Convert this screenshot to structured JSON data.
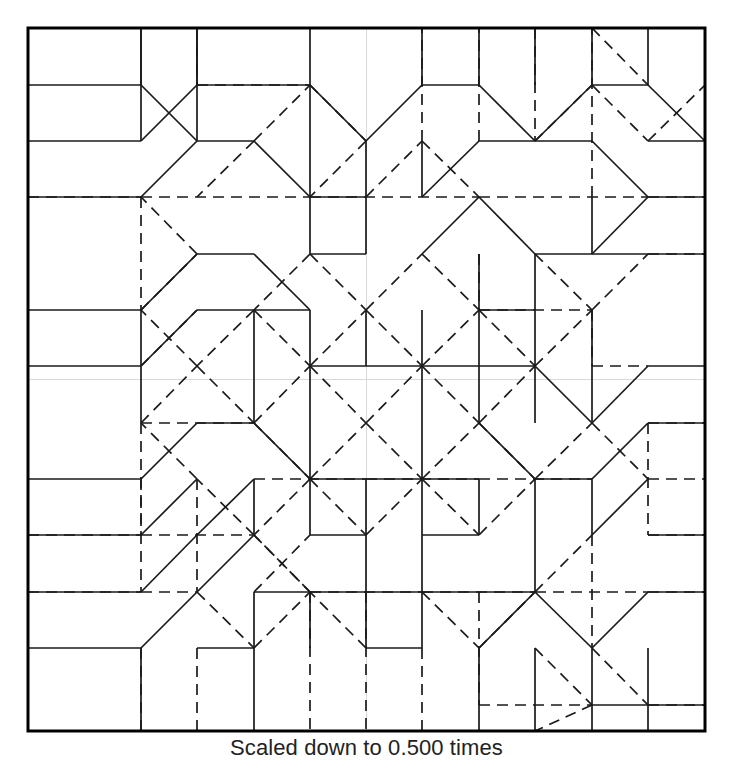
{
  "figure": {
    "type": "origami-crease-pattern",
    "caption": "Scaled down to 0.500 times",
    "colors": {
      "ink": "#1a1a1a",
      "border": "#000000",
      "guide": "#d9d9d9",
      "background": "#ffffff"
    },
    "paper": {
      "left": 28,
      "top": 28,
      "right": 705,
      "bottom": 731,
      "width": 677,
      "height": 703,
      "border_width": 3
    },
    "grid": {
      "columns": 12,
      "rows": 12,
      "cell_width": 56.4,
      "cell_height": 58.6,
      "center_guides": {
        "vertical_x": 366.5,
        "horizontal_y": 379.5
      }
    },
    "legend": {
      "solid_label": "mountain/valley crease (solid)",
      "dashed_label": "crease (dashed)",
      "guide_label": "center guide line"
    },
    "stroke": {
      "solid_width": 1.7,
      "dashed_width": 1.7,
      "dash_pattern": "11 7",
      "guide_width": 1
    }
  },
  "crease_pattern": {
    "units": "pixels",
    "note": "Coordinates are in the 733x768 image space. 'S' = solid crease, 'D' = dashed crease, 'G' = faint guide.",
    "solid": [
      [
        28,
        28,
        705,
        28
      ],
      [
        28,
        731,
        705,
        731
      ],
      [
        28,
        28,
        28,
        731
      ],
      [
        705,
        28,
        705,
        731
      ],
      [
        141,
        28,
        141,
        141
      ],
      [
        197,
        28,
        197,
        85
      ],
      [
        310,
        28,
        310,
        141
      ],
      [
        28,
        141,
        141,
        141
      ],
      [
        141,
        141,
        197,
        85
      ],
      [
        197,
        85,
        310,
        85
      ],
      [
        310,
        85,
        366,
        141
      ],
      [
        366,
        141,
        422,
        85
      ],
      [
        422,
        85,
        479,
        85
      ],
      [
        479,
        85,
        535,
        141
      ],
      [
        535,
        28,
        535,
        85
      ],
      [
        592,
        28,
        592,
        85
      ],
      [
        28,
        197,
        141,
        197
      ],
      [
        141,
        197,
        197,
        141
      ],
      [
        197,
        141,
        197,
        28
      ],
      [
        310,
        141,
        310,
        197
      ],
      [
        310,
        197,
        366,
        197
      ],
      [
        366,
        197,
        366,
        141
      ],
      [
        422,
        28,
        422,
        85
      ],
      [
        479,
        28,
        479,
        85
      ],
      [
        535,
        141,
        592,
        85
      ],
      [
        592,
        85,
        648,
        85
      ],
      [
        648,
        85,
        705,
        141
      ],
      [
        648,
        28,
        648,
        85
      ],
      [
        28,
        310,
        141,
        310
      ],
      [
        141,
        310,
        197,
        254
      ],
      [
        197,
        254,
        254,
        254
      ],
      [
        254,
        254,
        310,
        310
      ],
      [
        310,
        254,
        310,
        197
      ],
      [
        366,
        254,
        366,
        197
      ],
      [
        310,
        254,
        366,
        254
      ],
      [
        422,
        197,
        479,
        141
      ],
      [
        479,
        141,
        592,
        141
      ],
      [
        592,
        141,
        648,
        197
      ],
      [
        648,
        197,
        705,
        197
      ],
      [
        422,
        197,
        422,
        141
      ],
      [
        479,
        197,
        535,
        254
      ],
      [
        535,
        254,
        592,
        254
      ],
      [
        592,
        254,
        648,
        197
      ],
      [
        592,
        197,
        592,
        254
      ],
      [
        422,
        254,
        479,
        197
      ],
      [
        535,
        254,
        535,
        310
      ],
      [
        479,
        310,
        535,
        310
      ],
      [
        479,
        254,
        479,
        310
      ],
      [
        254,
        310,
        310,
        310
      ],
      [
        141,
        366,
        197,
        310
      ],
      [
        197,
        310,
        254,
        310
      ],
      [
        28,
        366,
        141,
        366
      ],
      [
        141,
        366,
        141,
        310
      ],
      [
        254,
        310,
        254,
        366
      ],
      [
        310,
        310,
        310,
        366
      ],
      [
        366,
        310,
        366,
        366
      ],
      [
        422,
        310,
        422,
        366
      ],
      [
        479,
        310,
        479,
        366
      ],
      [
        535,
        310,
        535,
        366
      ],
      [
        592,
        310,
        592,
        366
      ],
      [
        648,
        254,
        705,
        254
      ],
      [
        592,
        254,
        648,
        254
      ],
      [
        310,
        366,
        366,
        366
      ],
      [
        366,
        366,
        422,
        366
      ],
      [
        422,
        366,
        479,
        366
      ],
      [
        141,
        423,
        141,
        366
      ],
      [
        254,
        366,
        254,
        423
      ],
      [
        310,
        366,
        310,
        479
      ],
      [
        422,
        366,
        422,
        479
      ],
      [
        479,
        366,
        479,
        423
      ],
      [
        592,
        366,
        592,
        423
      ],
      [
        648,
        366,
        705,
        366
      ],
      [
        592,
        423,
        648,
        366
      ],
      [
        28,
        479,
        141,
        479
      ],
      [
        141,
        479,
        197,
        423
      ],
      [
        197,
        423,
        254,
        423
      ],
      [
        254,
        423,
        310,
        479
      ],
      [
        479,
        423,
        535,
        479
      ],
      [
        535,
        479,
        592,
        479
      ],
      [
        592,
        479,
        648,
        423
      ],
      [
        648,
        423,
        705,
        423
      ],
      [
        310,
        479,
        366,
        479
      ],
      [
        366,
        479,
        422,
        479
      ],
      [
        422,
        479,
        479,
        479
      ],
      [
        141,
        535,
        197,
        479
      ],
      [
        197,
        535,
        254,
        479
      ],
      [
        28,
        535,
        141,
        535
      ],
      [
        254,
        479,
        254,
        535
      ],
      [
        366,
        479,
        366,
        592
      ],
      [
        310,
        535,
        366,
        535
      ],
      [
        310,
        479,
        310,
        535
      ],
      [
        422,
        479,
        422,
        592
      ],
      [
        479,
        535,
        479,
        479
      ],
      [
        422,
        535,
        479,
        535
      ],
      [
        535,
        479,
        535,
        592
      ],
      [
        592,
        535,
        648,
        479
      ],
      [
        648,
        535,
        705,
        535
      ],
      [
        592,
        479,
        592,
        535
      ],
      [
        28,
        592,
        141,
        592
      ],
      [
        141,
        592,
        197,
        535
      ],
      [
        197,
        592,
        254,
        535
      ],
      [
        254,
        592,
        310,
        592
      ],
      [
        310,
        592,
        366,
        592
      ],
      [
        366,
        592,
        422,
        592
      ],
      [
        422,
        592,
        479,
        592
      ],
      [
        479,
        592,
        535,
        592
      ],
      [
        535,
        592,
        592,
        648
      ],
      [
        592,
        648,
        648,
        592
      ],
      [
        648,
        592,
        705,
        592
      ],
      [
        254,
        592,
        254,
        731
      ],
      [
        310,
        592,
        310,
        648
      ],
      [
        366,
        648,
        422,
        648
      ],
      [
        366,
        592,
        366,
        648
      ],
      [
        422,
        592,
        422,
        648
      ],
      [
        479,
        648,
        535,
        592
      ],
      [
        479,
        648,
        479,
        731
      ],
      [
        592,
        648,
        592,
        731
      ],
      [
        141,
        648,
        141,
        731
      ],
      [
        648,
        648,
        648,
        731
      ],
      [
        535,
        648,
        535,
        731
      ],
      [
        197,
        648,
        254,
        648
      ],
      [
        28,
        648,
        141,
        648
      ],
      [
        141,
        648,
        197,
        592
      ],
      [
        592,
        705,
        648,
        705
      ],
      [
        648,
        705,
        705,
        705
      ],
      [
        141,
        85,
        197,
        141
      ],
      [
        28,
        85,
        141,
        85
      ],
      [
        141,
        85,
        141,
        28
      ],
      [
        254,
        141,
        310,
        197
      ],
      [
        197,
        141,
        254,
        141
      ],
      [
        648,
        141,
        705,
        141
      ],
      [
        535,
        366,
        592,
        423
      ],
      [
        479,
        366,
        535,
        366
      ],
      [
        535,
        366,
        535,
        423
      ]
    ],
    "dashed": [
      [
        197,
        28,
        197,
        85
      ],
      [
        141,
        197,
        310,
        197
      ],
      [
        197,
        85,
        310,
        85
      ],
      [
        141,
        197,
        141,
        310
      ],
      [
        28,
        197,
        141,
        197
      ],
      [
        310,
        197,
        479,
        197
      ],
      [
        479,
        197,
        648,
        197
      ],
      [
        535,
        28,
        535,
        141
      ],
      [
        648,
        197,
        705,
        197
      ],
      [
        592,
        197,
        592,
        28
      ],
      [
        310,
        254,
        366,
        310
      ],
      [
        366,
        310,
        422,
        254
      ],
      [
        422,
        254,
        479,
        310
      ],
      [
        479,
        310,
        535,
        366
      ],
      [
        310,
        254,
        254,
        310
      ],
      [
        254,
        310,
        310,
        366
      ],
      [
        310,
        366,
        366,
        423
      ],
      [
        366,
        423,
        422,
        366
      ],
      [
        422,
        366,
        479,
        310
      ],
      [
        254,
        310,
        197,
        366
      ],
      [
        197,
        366,
        254,
        423
      ],
      [
        254,
        423,
        310,
        366
      ],
      [
        310,
        366,
        366,
        310
      ],
      [
        366,
        310,
        422,
        366
      ],
      [
        422,
        366,
        479,
        423
      ],
      [
        479,
        423,
        535,
        366
      ],
      [
        535,
        366,
        592,
        310
      ],
      [
        310,
        479,
        366,
        423
      ],
      [
        366,
        423,
        422,
        479
      ],
      [
        422,
        479,
        479,
        423
      ],
      [
        254,
        423,
        310,
        479
      ],
      [
        310,
        479,
        254,
        535
      ],
      [
        254,
        535,
        197,
        479
      ],
      [
        197,
        479,
        141,
        423
      ],
      [
        141,
        423,
        197,
        366
      ],
      [
        197,
        366,
        141,
        310
      ],
      [
        141,
        310,
        197,
        254
      ],
      [
        197,
        254,
        141,
        197
      ],
      [
        310,
        85,
        366,
        141
      ],
      [
        366,
        141,
        310,
        197
      ],
      [
        254,
        141,
        310,
        85
      ],
      [
        254,
        141,
        197,
        197
      ],
      [
        310,
        479,
        366,
        535
      ],
      [
        366,
        535,
        422,
        479
      ],
      [
        422,
        479,
        479,
        535
      ],
      [
        479,
        535,
        535,
        479
      ],
      [
        535,
        479,
        592,
        423
      ],
      [
        592,
        423,
        648,
        479
      ],
      [
        648,
        479,
        705,
        479
      ],
      [
        592,
        310,
        648,
        254
      ],
      [
        648,
        254,
        705,
        254
      ],
      [
        479,
        423,
        535,
        479
      ],
      [
        141,
        479,
        141,
        592
      ],
      [
        28,
        592,
        141,
        592
      ],
      [
        141,
        592,
        197,
        592
      ],
      [
        592,
        535,
        592,
        648
      ],
      [
        648,
        592,
        705,
        592
      ],
      [
        535,
        592,
        592,
        535
      ],
      [
        592,
        648,
        648,
        705
      ],
      [
        648,
        705,
        705,
        705
      ],
      [
        535,
        648,
        592,
        705
      ],
      [
        592,
        705,
        535,
        731
      ],
      [
        141,
        648,
        141,
        731
      ],
      [
        197,
        648,
        197,
        731
      ],
      [
        310,
        592,
        310,
        731
      ],
      [
        366,
        592,
        366,
        731
      ],
      [
        422,
        648,
        422,
        731
      ],
      [
        422,
        592,
        479,
        648
      ],
      [
        479,
        648,
        535,
        592
      ],
      [
        366,
        648,
        310,
        592
      ],
      [
        197,
        592,
        254,
        648
      ],
      [
        254,
        648,
        310,
        592
      ],
      [
        310,
        592,
        254,
        535
      ],
      [
        254,
        535,
        310,
        592
      ],
      [
        254,
        592,
        310,
        535
      ],
      [
        592,
        366,
        648,
        366
      ],
      [
        479,
        310,
        592,
        310
      ],
      [
        592,
        310,
        592,
        366
      ],
      [
        479,
        254,
        479,
        310
      ],
      [
        535,
        254,
        592,
        310
      ],
      [
        366,
        197,
        422,
        141
      ],
      [
        422,
        141,
        479,
        197
      ],
      [
        535,
        141,
        592,
        85
      ],
      [
        592,
        85,
        648,
        141
      ],
      [
        648,
        141,
        705,
        85
      ],
      [
        592,
        28,
        648,
        85
      ],
      [
        141,
        423,
        254,
        423
      ],
      [
        141,
        423,
        141,
        535
      ],
      [
        28,
        535,
        141,
        535
      ],
      [
        141,
        535,
        254,
        535
      ],
      [
        254,
        479,
        366,
        479
      ],
      [
        366,
        479,
        479,
        479
      ],
      [
        479,
        479,
        592,
        479
      ],
      [
        479,
        141,
        479,
        28
      ],
      [
        422,
        141,
        422,
        28
      ],
      [
        310,
        592,
        422,
        592
      ],
      [
        422,
        592,
        535,
        592
      ],
      [
        535,
        592,
        648,
        592
      ],
      [
        197,
        479,
        197,
        592
      ],
      [
        648,
        423,
        648,
        535
      ],
      [
        648,
        535,
        705,
        535
      ],
      [
        648,
        423,
        705,
        423
      ],
      [
        479,
        592,
        479,
        705
      ],
      [
        479,
        705,
        592,
        705
      ],
      [
        141,
        366,
        197,
        310
      ]
    ],
    "guides": [
      [
        28,
        379.5,
        705,
        379.5
      ],
      [
        366.5,
        28,
        366.5,
        731
      ]
    ]
  }
}
